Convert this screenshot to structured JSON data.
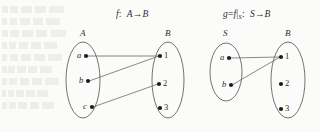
{
  "figure": {
    "kind": "function-mapping-diagram",
    "background_color": "#fbfbfa",
    "ink_color": "#2b2b2b",
    "line_color": "#6b6b6b"
  },
  "left_diagram": {
    "function_label": {
      "name": "f",
      "separator": ":",
      "domain": "A",
      "arrow": "→",
      "codomain": "B",
      "full": "f: A→B"
    },
    "domain_set": {
      "label": "A",
      "elements": [
        {
          "label": "a",
          "x": 86,
          "y": 56
        },
        {
          "label": "b",
          "x": 88,
          "y": 81
        },
        {
          "label": "c",
          "x": 92,
          "y": 107
        }
      ],
      "ellipse": {
        "cx": 83,
        "cy": 80,
        "rx": 17,
        "ry": 38
      }
    },
    "codomain_set": {
      "label": "B",
      "elements": [
        {
          "label": "1",
          "x": 160,
          "y": 56
        },
        {
          "label": "2",
          "x": 159,
          "y": 84
        },
        {
          "label": "3",
          "x": 160,
          "y": 108
        }
      ],
      "ellipse": {
        "cx": 168,
        "cy": 80,
        "rx": 16,
        "ry": 38
      }
    },
    "mappings": [
      {
        "from": "a",
        "to": "1"
      },
      {
        "from": "b",
        "to": "1"
      },
      {
        "from": "c",
        "to": "2"
      }
    ]
  },
  "right_diagram": {
    "function_label": {
      "name": "g",
      "equals": "=",
      "restriction_of": "f",
      "bar": "|",
      "restricted_to": "S",
      "separator": ":",
      "domain": "S",
      "arrow": "→",
      "codomain": "B",
      "full": "g=f|S: S→B"
    },
    "domain_set": {
      "label": "S",
      "elements": [
        {
          "label": "a",
          "x": 229,
          "y": 58
        },
        {
          "label": "b",
          "x": 231,
          "y": 85
        }
      ],
      "ellipse": {
        "cx": 226,
        "cy": 72,
        "rx": 16,
        "ry": 29
      }
    },
    "codomain_set": {
      "label": "B",
      "elements": [
        {
          "label": "1",
          "x": 281,
          "y": 57
        },
        {
          "label": "2",
          "x": 281,
          "y": 84
        },
        {
          "label": "3",
          "x": 281,
          "y": 109
        }
      ],
      "ellipse": {
        "cx": 288,
        "cy": 80,
        "rx": 17,
        "ry": 38
      }
    },
    "mappings": [
      {
        "from": "a",
        "to": "1"
      },
      {
        "from": "b",
        "to": "1"
      }
    ]
  }
}
